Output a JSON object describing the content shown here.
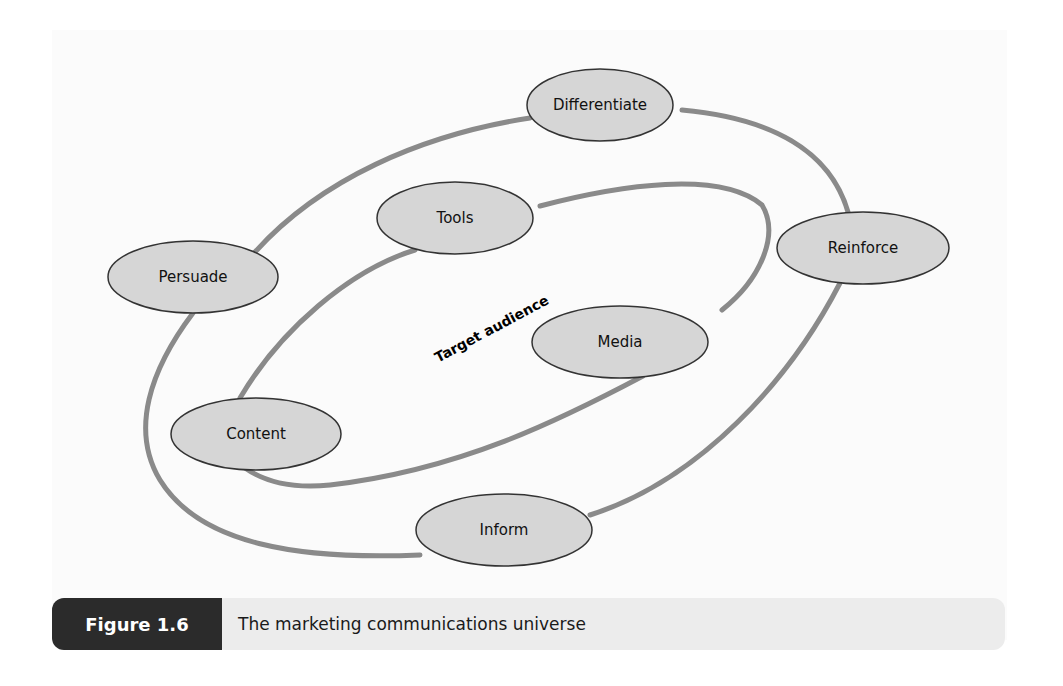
{
  "figure": {
    "label": "Figure 1.6",
    "caption": "The marketing communications universe"
  },
  "diagram": {
    "center_label": "Target audience",
    "outer_ring_nodes": [
      {
        "label": "Differentiate",
        "cx": 600,
        "cy": 105,
        "rx": 73,
        "ry": 36
      },
      {
        "label": "Reinforce",
        "cx": 863,
        "cy": 248,
        "rx": 86,
        "ry": 36
      },
      {
        "label": "Inform",
        "cx": 504,
        "cy": 530,
        "rx": 88,
        "ry": 36
      },
      {
        "label": "Persuade",
        "cx": 193,
        "cy": 277,
        "rx": 85,
        "ry": 36
      }
    ],
    "inner_ring_nodes": [
      {
        "label": "Tools",
        "cx": 455,
        "cy": 218,
        "rx": 78,
        "ry": 36
      },
      {
        "label": "Media",
        "cx": 620,
        "cy": 342,
        "rx": 88,
        "ry": 36
      },
      {
        "label": "Content",
        "cx": 256,
        "cy": 434,
        "rx": 85,
        "ry": 36
      }
    ],
    "colors": {
      "ring_stroke": "#8a8a8a",
      "node_fill": "#d6d6d6",
      "node_stroke": "#333333",
      "caption_label_bg": "#2b2b2b",
      "caption_text_bg": "#ececec"
    }
  }
}
